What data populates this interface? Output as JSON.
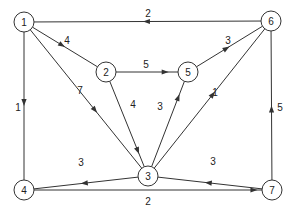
{
  "diagram": {
    "type": "directed-weighted-graph",
    "nodes": [
      {
        "id": "1",
        "label": "1",
        "x": 24,
        "y": 22
      },
      {
        "id": "2",
        "label": "2",
        "x": 106,
        "y": 72
      },
      {
        "id": "3",
        "label": "3",
        "x": 148,
        "y": 176
      },
      {
        "id": "4",
        "label": "4",
        "x": 24,
        "y": 190
      },
      {
        "id": "5",
        "label": "5",
        "x": 188,
        "y": 72
      },
      {
        "id": "6",
        "label": "6",
        "x": 271,
        "y": 21
      },
      {
        "id": "7",
        "label": "7",
        "x": 272,
        "y": 190
      }
    ],
    "edges": [
      {
        "from": "6",
        "to": "1",
        "weight": "2",
        "lx": 148,
        "ly": 13,
        "arrow_t": 0.52
      },
      {
        "from": "1",
        "to": "2",
        "weight": "4",
        "lx": 67,
        "ly": 40,
        "arrow_t": 0.5
      },
      {
        "from": "1",
        "to": "3",
        "weight": "7",
        "lx": 80,
        "ly": 90,
        "arrow_t": 0.6
      },
      {
        "from": "1",
        "to": "4",
        "weight": "1",
        "lx": 18,
        "ly": 107,
        "arrow_t": 0.5
      },
      {
        "from": "2",
        "to": "5",
        "weight": "5",
        "lx": 146,
        "ly": 64,
        "arrow_t": 0.85
      },
      {
        "from": "2",
        "to": "3",
        "weight": "4",
        "lx": 133,
        "ly": 104,
        "arrow_t": 0.85
      },
      {
        "from": "5",
        "to": "6",
        "weight": "3",
        "lx": 228,
        "ly": 40,
        "arrow_t": 0.5
      },
      {
        "from": "3",
        "to": "5",
        "weight": "3",
        "lx": 160,
        "ly": 106,
        "arrow_t": 0.85
      },
      {
        "from": "3",
        "to": "6",
        "weight": "1",
        "lx": 215,
        "ly": 92,
        "arrow_t": 0.55
      },
      {
        "from": "3",
        "to": "4",
        "weight": "3",
        "lx": 81,
        "ly": 162,
        "arrow_t": 0.55
      },
      {
        "from": "7",
        "to": "3",
        "weight": "3",
        "lx": 213,
        "ly": 161,
        "arrow_t": 0.55
      },
      {
        "from": "4",
        "to": "7",
        "weight": "2",
        "lx": 148,
        "ly": 201,
        "arrow_t": 0.98
      },
      {
        "from": "7",
        "to": "6",
        "weight": "5",
        "lx": 280,
        "ly": 107,
        "arrow_t": 0.5
      }
    ],
    "node_radius": 10,
    "colors": {
      "stroke": "#333333",
      "text": "#222222",
      "background": "#ffffff"
    }
  }
}
